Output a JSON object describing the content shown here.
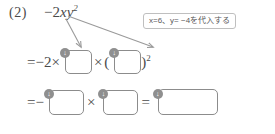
{
  "worksheet": {
    "problem_number": "(2)",
    "expression_prefix": "−2",
    "expression_vars": "xy",
    "expression_exponent": "2"
  },
  "hint": {
    "text": "x=6、y= −4を代入する"
  },
  "line2": {
    "equals_lead": "=−2×",
    "times": "×",
    "open_paren": "(",
    "close_paren": ")",
    "exponent": "2",
    "marker_1": "↓",
    "marker_2": "↓",
    "box1_value": "",
    "box2_value": ""
  },
  "line3": {
    "equals_lead": "=−",
    "times": "×",
    "equals_mid": "=",
    "marker_1": "↓",
    "marker_2": "↓",
    "marker_3": "↓",
    "box1_value": "",
    "box2_value": "",
    "box3_value": ""
  },
  "icons": {
    "arrow_short": "arrow-down-left-icon",
    "arrow_long": "arrow-down-right-icon",
    "underline": "wavy-underline-icon"
  },
  "colors": {
    "ink": "#4a4a4a",
    "box_border": "#8c8c8c",
    "marker_fill": "#8f8f8f",
    "callout_border": "#bfbfbf",
    "arrow": "#9a9a9a"
  }
}
